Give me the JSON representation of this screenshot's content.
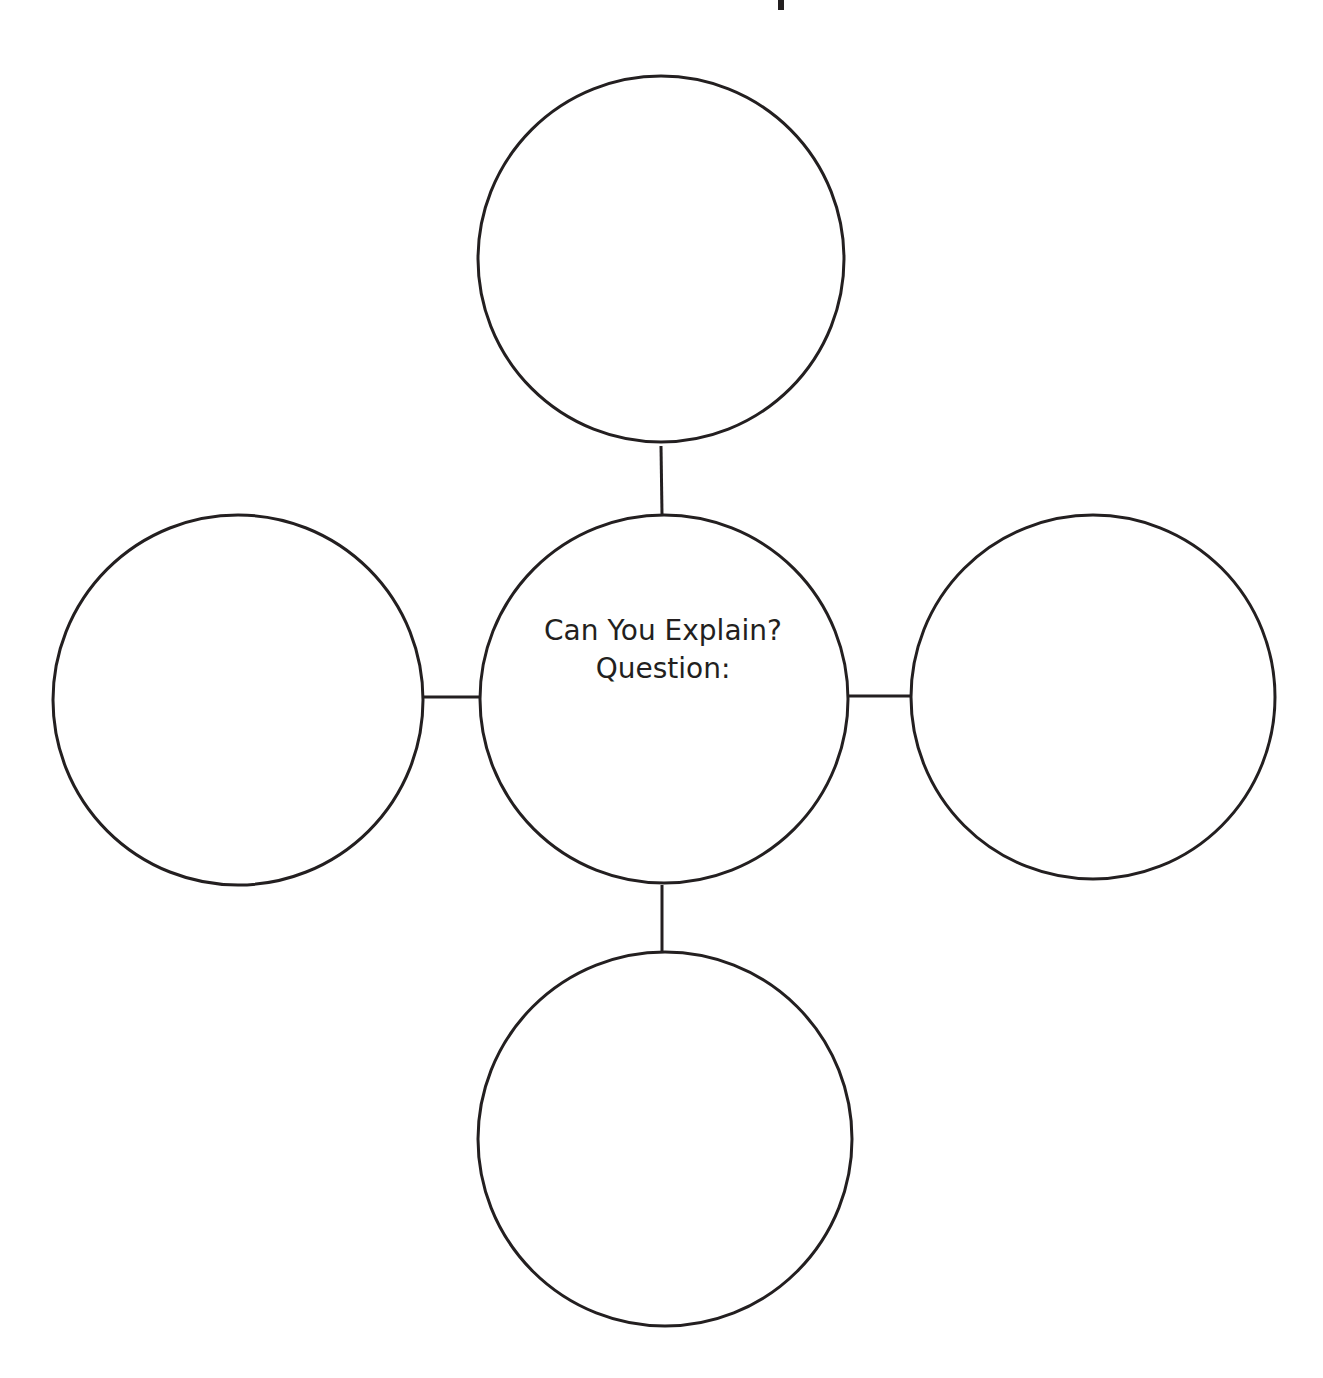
{
  "title": {
    "text": "Concept Map",
    "visible": "cut off at top edge (only descender fragment visible)"
  },
  "diagram": {
    "type": "concept-map",
    "stroke_color": "#231f20",
    "background_color": "#ffffff",
    "center_node": {
      "line1": "Can You Explain?",
      "line2": "Question:"
    },
    "nodes": [
      {
        "id": "top",
        "label": ""
      },
      {
        "id": "left",
        "label": ""
      },
      {
        "id": "right",
        "label": ""
      },
      {
        "id": "bottom",
        "label": ""
      }
    ]
  }
}
